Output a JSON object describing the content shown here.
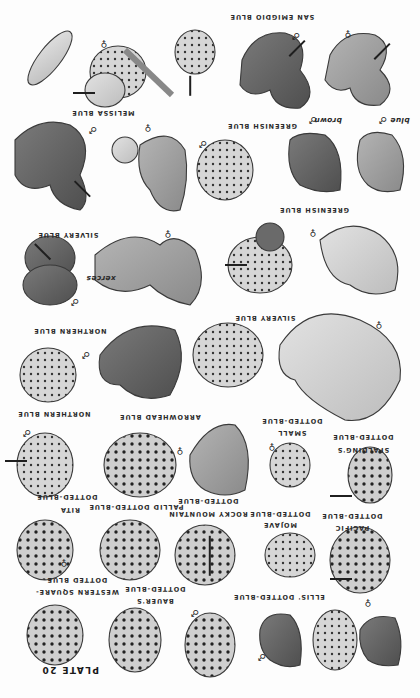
{
  "plate": {
    "title": "PLATE 20",
    "orientation": "rotated 180 degrees",
    "colors": {
      "background": "#fdfdfd",
      "ink": "#2a2a2a",
      "wing_light": "#cfcfcf",
      "wing_mid": "#9a9a9a",
      "wing_dark": "#5e5e5e"
    }
  },
  "labels": [
    {
      "id": "san-emigdio-blue",
      "text": "SAN EMIGDIO BLUE",
      "x": 272,
      "y": 17
    },
    {
      "id": "melissa-blue",
      "text": "MELISSA BLUE",
      "x": 103,
      "y": 113
    },
    {
      "id": "greenish-blue-upper",
      "text": "GREENISH BLUE",
      "x": 262,
      "y": 126
    },
    {
      "id": "brown",
      "text": "brown",
      "x": 318,
      "y": 120,
      "italic": true
    },
    {
      "id": "blue",
      "text": "blue",
      "x": 392,
      "y": 120,
      "italic": true
    },
    {
      "id": "greenish-blue-mid",
      "text": "GREENISH BLUE",
      "x": 314,
      "y": 210
    },
    {
      "id": "silvery-blue-upper",
      "text": "SILVERY BLUE",
      "x": 68,
      "y": 235
    },
    {
      "id": "xerces",
      "text": "xerces",
      "x": 101,
      "y": 278,
      "italic": true
    },
    {
      "id": "northern-blue-upper",
      "text": "NORTHERN BLUE",
      "x": 70,
      "y": 331
    },
    {
      "id": "silvery-blue-mid",
      "text": "SILVERY BLUE",
      "x": 265,
      "y": 318
    },
    {
      "id": "northern-blue-lower",
      "text": "NORTHERN BLUE",
      "x": 54,
      "y": 414
    },
    {
      "id": "arrowhead-blue",
      "text": "ARROWHEAD BLUE",
      "x": 160,
      "y": 417
    },
    {
      "id": "small-dotted-blue-1",
      "text": "DOTTED-BLUE",
      "x": 292,
      "y": 421
    },
    {
      "id": "small-dotted-blue-2",
      "text": "SMALL",
      "x": 292,
      "y": 433
    },
    {
      "id": "spaldings-1",
      "text": "DOTTED-BLUE",
      "x": 363,
      "y": 437
    },
    {
      "id": "spaldings-2",
      "text": "SPALDING'S",
      "x": 363,
      "y": 450
    },
    {
      "id": "rita-1",
      "text": "DOTTED-BLUE",
      "x": 67,
      "y": 497
    },
    {
      "id": "rita-2",
      "text": "RITA",
      "x": 70,
      "y": 510
    },
    {
      "id": "pallid-dotted-blue",
      "text": "PALLID DOTTED-BLUE",
      "x": 136,
      "y": 507
    },
    {
      "id": "rocky-mountain-1",
      "text": "DOTTED-BLUE",
      "x": 208,
      "y": 501
    },
    {
      "id": "rocky-mountain-2",
      "text": "ROCKY MOUNTAIN",
      "x": 208,
      "y": 514
    },
    {
      "id": "mojave-1",
      "text": "DOTTED-BLUE",
      "x": 280,
      "y": 514
    },
    {
      "id": "mojave-2",
      "text": "MOJAVE",
      "x": 280,
      "y": 525
    },
    {
      "id": "pacific-1",
      "text": "DOTTED-BLUE",
      "x": 352,
      "y": 516
    },
    {
      "id": "pacific-2",
      "text": "PACIFIC",
      "x": 352,
      "y": 528
    },
    {
      "id": "western-square-1",
      "text": "DOTTED BLUE",
      "x": 77,
      "y": 580
    },
    {
      "id": "western-square-2",
      "text": "WESTERN SQUARE-",
      "x": 77,
      "y": 592
    },
    {
      "id": "bauers-1",
      "text": "DOTTED-BLUE",
      "x": 155,
      "y": 589
    },
    {
      "id": "bauers-2",
      "text": "BAUER'S",
      "x": 155,
      "y": 601
    },
    {
      "id": "ellis-dotted-blue",
      "text": "ELLIS' DOTTED-BLUE",
      "x": 279,
      "y": 597
    }
  ],
  "sex_symbols": [
    {
      "sym": "♂",
      "x": 296,
      "y": 35
    },
    {
      "sym": "♀",
      "x": 348,
      "y": 33
    },
    {
      "sym": "♀",
      "x": 104,
      "y": 43
    },
    {
      "sym": "♂",
      "x": 93,
      "y": 129
    },
    {
      "sym": "♀",
      "x": 148,
      "y": 127
    },
    {
      "sym": "♂",
      "x": 203,
      "y": 143
    },
    {
      "sym": "♂",
      "x": 313,
      "y": 119
    },
    {
      "sym": "♂",
      "x": 383,
      "y": 119
    },
    {
      "sym": "♀",
      "x": 313,
      "y": 232
    },
    {
      "sym": "♀",
      "x": 168,
      "y": 233
    },
    {
      "sym": "♂",
      "x": 75,
      "y": 301
    },
    {
      "sym": "♀",
      "x": 379,
      "y": 324
    },
    {
      "sym": "♂",
      "x": 86,
      "y": 354
    },
    {
      "sym": "♂",
      "x": 27,
      "y": 432
    },
    {
      "sym": "♀",
      "x": 180,
      "y": 450
    },
    {
      "sym": "♀",
      "x": 272,
      "y": 446
    },
    {
      "sym": "♀",
      "x": 64,
      "y": 562
    },
    {
      "sym": "♂",
      "x": 195,
      "y": 612
    },
    {
      "sym": "♂",
      "x": 262,
      "y": 656
    },
    {
      "sym": "♀",
      "x": 368,
      "y": 602
    }
  ]
}
